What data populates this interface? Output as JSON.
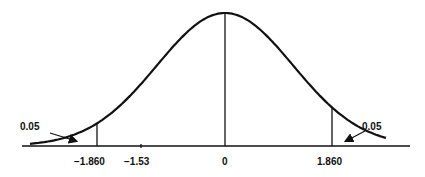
{
  "chart_data": {
    "type": "line",
    "title": "",
    "xlabel": "",
    "ylabel": "",
    "x_ticks": [
      {
        "label": "−1.860",
        "value": -1.86
      },
      {
        "label": "−1.53",
        "value": -1.53
      },
      {
        "label": "0",
        "value": 0
      },
      {
        "label": "1.860",
        "value": 1.86
      }
    ],
    "critical_values": [
      -1.86,
      1.86
    ],
    "observed_statistic": -1.53,
    "tail_areas": [
      {
        "side": "left",
        "label": "0.05",
        "area": 0.05
      },
      {
        "side": "right",
        "label": "0.05",
        "area": 0.05
      }
    ],
    "center": 0,
    "xlim": [
      -3.2,
      3.2
    ],
    "grid": false,
    "legend": null
  },
  "labels": {
    "left_tail": "0.05",
    "right_tail": "0.05",
    "tick_neg_crit": "−1.860",
    "tick_obs": "−1.53",
    "tick_zero": "0",
    "tick_pos_crit": "1.860"
  },
  "colors": {
    "line": "#111111",
    "background": "#ffffff"
  }
}
